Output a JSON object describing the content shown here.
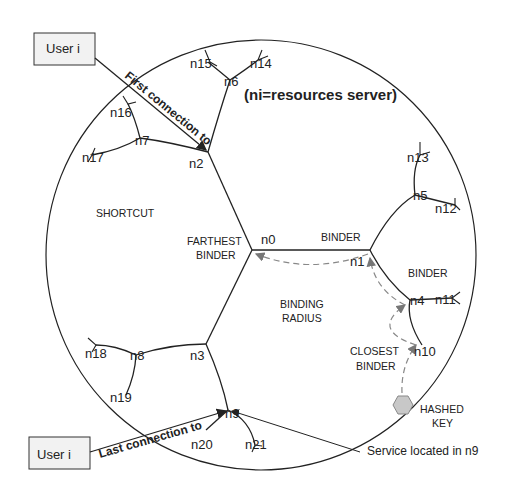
{
  "diagram": {
    "title": "(ni=resources server)",
    "users": {
      "top": "User i",
      "bottom": "User i"
    },
    "connections": {
      "first": "First connection to",
      "last": "Last connection to"
    },
    "regions": {
      "shortcut": "SHORTCUT",
      "farthest_line1": "FARTHEST",
      "farthest_line2": "BINDER",
      "binder_top": "BINDER",
      "binder_right": "BINDER",
      "binding_line1": "BINDING",
      "binding_line2": "RADIUS",
      "closest_line1": "CLOSEST",
      "closest_line2": "BINDER",
      "hashed_line1": "HASHED",
      "hashed_line2": "KEY",
      "service": "Service located in n9"
    },
    "nodes": {
      "n0": "n0",
      "n1": "n1",
      "n2": "n2",
      "n3": "n3",
      "n4": "n4",
      "n5": "n5",
      "n6": "n6",
      "n7": "n7",
      "n8": "n8",
      "n9": "n9",
      "n10": "n10",
      "n11": "n11",
      "n12": "n12",
      "n13": "n13",
      "n14": "n14",
      "n15": "n15",
      "n16": "n16",
      "n17": "n17",
      "n18": "n18",
      "n19": "n19",
      "n20": "n20",
      "n21": "n21"
    },
    "colors": {
      "line": "#222222",
      "dashed": "#888888",
      "hashed_key": "#c8c8c8"
    }
  }
}
